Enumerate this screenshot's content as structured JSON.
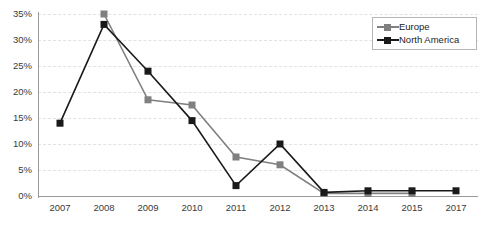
{
  "chart_data": {
    "type": "line",
    "title": "",
    "subtitle": "",
    "xlabel": "",
    "ylabel": "",
    "categories": [
      "2007",
      "2008",
      "2009",
      "2010",
      "2011",
      "2012",
      "2013",
      "2014",
      "2015",
      "2017"
    ],
    "ylim": [
      0,
      35
    ],
    "ytick_labels": [
      "0%",
      "5%",
      "10%",
      "15%",
      "20%",
      "25%",
      "30%",
      "35%"
    ],
    "ytick_values": [
      0,
      5,
      10,
      15,
      20,
      25,
      30,
      35
    ],
    "grid": "horizontal-dashed",
    "legend_position": "top-right",
    "series": [
      {
        "name": "Europe",
        "color": "#808080",
        "marker": "square",
        "values": [
          null,
          35,
          18.5,
          17.5,
          7.5,
          6,
          0.5,
          0.5,
          0.5,
          null
        ]
      },
      {
        "name": "North America",
        "color": "#1a1a1a",
        "marker": "square",
        "values": [
          14,
          33,
          24,
          14.5,
          2,
          10,
          0.7,
          1,
          1,
          1
        ]
      }
    ]
  },
  "legend": {
    "items": [
      {
        "label": "Europe"
      },
      {
        "label": "North America"
      }
    ]
  },
  "colors": {
    "europe": "#808080",
    "north_america": "#1a1a1a",
    "grid": "#e2e2e6",
    "axis": "#9a9a9a",
    "text": "#3a3a3a",
    "background": "#ffffff"
  }
}
